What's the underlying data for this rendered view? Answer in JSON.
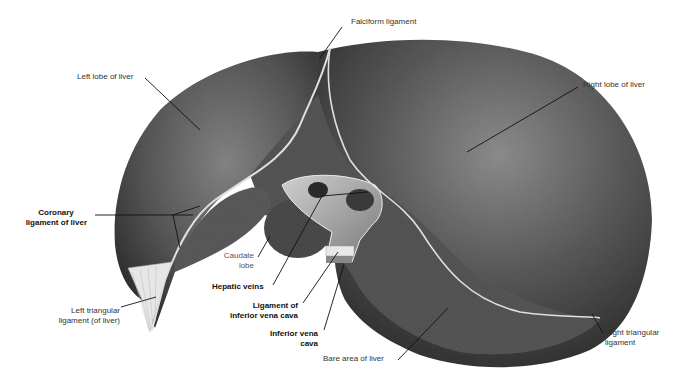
{
  "figure": {
    "labels": {
      "falciform": "Falciform ligament",
      "left_lobe": "Left lobe of liver",
      "right_lobe": "Right lobe of liver",
      "coronary_1": "Coronary",
      "coronary_2": "ligament of liver",
      "caudate_1": "Caudate",
      "caudate_2": "lobe",
      "hepatic_veins": "Hepatic veins",
      "lig_ivc_1": "Ligament of",
      "lig_ivc_2": "inferior vena cava",
      "ivc_1": "Inferior vena",
      "ivc_2": "cava",
      "left_tri_1": "Left triangular",
      "left_tri_2": "ligament (of liver)",
      "right_tri_1": "Right triangular",
      "right_tri_2": "ligament",
      "bare_area": "Bare area of liver"
    },
    "colors": {
      "liver_dark": "#3a3a3a",
      "liver_mid": "#6a6a6a",
      "liver_light": "#9a9a9a",
      "ligament": "#d8d8d8",
      "leader": "#111111",
      "label_text": "#333333"
    }
  }
}
